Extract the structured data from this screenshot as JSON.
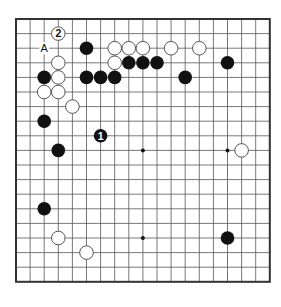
{
  "board": {
    "size": 19,
    "origin_x": 16,
    "origin_y": 19,
    "step_x": 14.1,
    "step_y": 14.6,
    "line_color": "#555555",
    "border_color": "#333333",
    "stone_black": "#111111",
    "stone_white": "#ffffff",
    "stone_outline": "#444444"
  },
  "star_points": [
    [
      9,
      9
    ],
    [
      15,
      9
    ],
    [
      9,
      15
    ]
  ],
  "stones": {
    "black": [
      [
        5,
        2
      ],
      [
        8,
        3
      ],
      [
        9,
        3
      ],
      [
        10,
        3
      ],
      [
        15,
        3
      ],
      [
        2,
        4
      ],
      [
        5,
        4
      ],
      [
        6,
        4
      ],
      [
        7,
        4
      ],
      [
        12,
        4
      ],
      [
        2,
        7
      ],
      [
        3,
        9
      ],
      [
        2,
        13
      ],
      [
        15,
        15
      ]
    ],
    "white": [
      [
        7,
        2
      ],
      [
        8,
        2
      ],
      [
        9,
        2
      ],
      [
        11,
        2
      ],
      [
        13,
        2
      ],
      [
        3,
        3
      ],
      [
        7,
        3
      ],
      [
        3,
        4
      ],
      [
        2,
        5
      ],
      [
        3,
        5
      ],
      [
        4,
        6
      ],
      [
        16,
        9
      ],
      [
        3,
        15
      ],
      [
        5,
        16
      ]
    ]
  },
  "numbered_moves": [
    {
      "number": "1",
      "color": "black",
      "col": 6,
      "row": 8
    },
    {
      "number": "2",
      "color": "white",
      "col": 3,
      "row": 1
    }
  ],
  "labels": [
    {
      "text": "A",
      "col": 2,
      "row": 2
    }
  ]
}
